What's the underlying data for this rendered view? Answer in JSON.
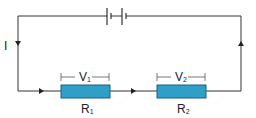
{
  "diagram": {
    "type": "series-circuit",
    "current_label": "I",
    "components": [
      {
        "id": "battery",
        "kind": "battery",
        "cells": 2
      },
      {
        "id": "R1",
        "kind": "resistor",
        "label": "R",
        "subscript": "1",
        "voltage_label": "V",
        "voltage_subscript": "1"
      },
      {
        "id": "R2",
        "kind": "resistor",
        "label": "R",
        "subscript": "2",
        "voltage_label": "V",
        "voltage_subscript": "2"
      }
    ],
    "colors": {
      "wire": "#333333",
      "resistor_fill": "#2f9fc8",
      "resistor_stroke": "#1d5f7a"
    }
  }
}
